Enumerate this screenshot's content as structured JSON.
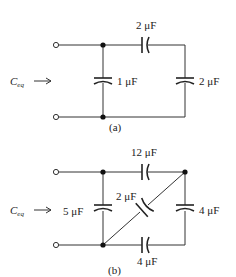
{
  "diagrams": [
    {
      "id": "a",
      "caption": "(a)",
      "input_label": "C",
      "input_label_sub": "eq",
      "capacitors": [
        {
          "name": "series-top",
          "value": "2",
          "unit": "μF",
          "position": "top wire"
        },
        {
          "name": "shunt-left",
          "value": "1",
          "unit": "μF",
          "position": "left vertical"
        },
        {
          "name": "shunt-right",
          "value": "2",
          "unit": "μF",
          "position": "right vertical"
        }
      ]
    },
    {
      "id": "b",
      "caption": "(b)",
      "input_label": "C",
      "input_label_sub": "eq",
      "capacitors": [
        {
          "name": "top",
          "value": "12",
          "unit": "μF",
          "position": "top wire"
        },
        {
          "name": "left",
          "value": "5",
          "unit": "μF",
          "position": "left vertical"
        },
        {
          "name": "diagonal",
          "value": "2",
          "unit": "μF",
          "position": "diagonal"
        },
        {
          "name": "right",
          "value": "4",
          "unit": "μF",
          "position": "right vertical"
        },
        {
          "name": "bottom",
          "value": "4",
          "unit": "μF",
          "position": "bottom wire"
        }
      ]
    }
  ],
  "labels": {
    "a_top": "2 μF",
    "a_left": "1 μF",
    "a_right": "2 μF",
    "a_caption": "(a)",
    "b_top": "12 μF",
    "b_left": "5 μF",
    "b_diag": "2 μF",
    "b_right": "4 μF",
    "b_bottom": "4 μF",
    "b_caption": "(b)",
    "ceq_main": "C",
    "ceq_sub": "eq"
  }
}
